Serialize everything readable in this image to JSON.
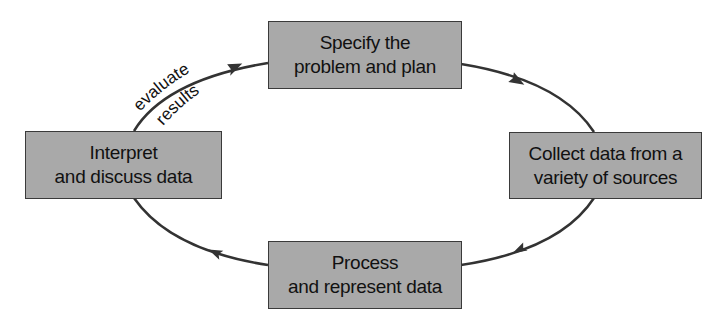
{
  "diagram": {
    "type": "cycle",
    "colors": {
      "box_fill": "#a9a9a9",
      "box_border": "#3a3a3a",
      "arrow": "#333333",
      "text": "#111111"
    },
    "nodes": [
      {
        "id": "specify",
        "line1": "Specify the",
        "line2": "problem and plan"
      },
      {
        "id": "collect",
        "line1": "Collect data from a",
        "line2": "variety of sources"
      },
      {
        "id": "process",
        "line1": "Process",
        "line2": "and represent data"
      },
      {
        "id": "interpret",
        "line1": "Interpret",
        "line2": "and discuss data"
      }
    ],
    "edges": [
      {
        "from": "specify",
        "to": "collect",
        "label": ""
      },
      {
        "from": "collect",
        "to": "process",
        "label": ""
      },
      {
        "from": "process",
        "to": "interpret",
        "label": ""
      },
      {
        "from": "interpret",
        "to": "specify",
        "label_line1": "evaluate",
        "label_line2": "results"
      }
    ]
  }
}
